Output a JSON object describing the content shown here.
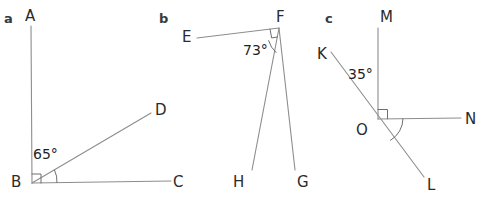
{
  "figure": {
    "background_color": "#ffffff",
    "line_color": "#8d8d8d",
    "label_color": "#2b2b2b",
    "panels": [
      {
        "letter": "a",
        "letter_pos": [
          4,
          23
        ],
        "vertex_labels": [
          {
            "text": "A",
            "x": 25,
            "y": 21
          },
          {
            "text": "B",
            "x": 11,
            "y": 187
          },
          {
            "text": "C",
            "x": 173,
            "y": 187
          },
          {
            "text": "D",
            "x": 155,
            "y": 115
          }
        ],
        "angle_labels": [
          {
            "text": "65°",
            "x": 33,
            "y": 159
          }
        ]
      },
      {
        "letter": "b",
        "letter_pos": [
          159,
          23
        ],
        "vertex_labels": [
          {
            "text": "E",
            "x": 182,
            "y": 42
          },
          {
            "text": "F",
            "x": 276,
            "y": 22
          },
          {
            "text": "G",
            "x": 297,
            "y": 187
          },
          {
            "text": "H",
            "x": 233,
            "y": 187
          }
        ],
        "angle_labels": [
          {
            "text": "73°",
            "x": 243,
            "y": 55
          }
        ]
      },
      {
        "letter": "c",
        "letter_pos": [
          325,
          23
        ],
        "vertex_labels": [
          {
            "text": "K",
            "x": 317,
            "y": 59
          },
          {
            "text": "L",
            "x": 427,
            "y": 190
          },
          {
            "text": "M",
            "x": 380,
            "y": 22
          },
          {
            "text": "N",
            "x": 465,
            "y": 124
          },
          {
            "text": "O",
            "x": 356,
            "y": 135
          }
        ],
        "angle_labels": [
          {
            "text": "35°",
            "x": 348,
            "y": 79
          }
        ]
      }
    ],
    "segments": [
      {
        "name": "segment-BA",
        "x1": 32,
        "y1": 183,
        "x2": 31,
        "y2": 26
      },
      {
        "name": "segment-BC",
        "x1": 32,
        "y1": 183,
        "x2": 171,
        "y2": 181
      },
      {
        "name": "segment-BD",
        "x1": 32,
        "y1": 183,
        "x2": 151,
        "y2": 113
      },
      {
        "name": "segment-FE",
        "x1": 279,
        "y1": 28,
        "x2": 197,
        "y2": 38
      },
      {
        "name": "segment-FH",
        "x1": 279,
        "y1": 28,
        "x2": 252,
        "y2": 170
      },
      {
        "name": "segment-FG",
        "x1": 279,
        "y1": 28,
        "x2": 295,
        "y2": 170
      },
      {
        "name": "segment-OM",
        "x1": 378,
        "y1": 119,
        "x2": 378,
        "y2": 28
      },
      {
        "name": "segment-ON",
        "x1": 378,
        "y1": 119,
        "x2": 461,
        "y2": 118
      },
      {
        "name": "segment-KL",
        "x1": 331,
        "y1": 52,
        "x2": 424,
        "y2": 177
      }
    ],
    "markers": [
      {
        "name": "right-angle-marker-B",
        "type": "square"
      },
      {
        "name": "angle-arc-DBC",
        "type": "arc"
      },
      {
        "name": "right-angle-marker-F",
        "type": "square"
      },
      {
        "name": "angle-arc-EFH",
        "type": "arc"
      },
      {
        "name": "right-angle-marker-O",
        "type": "square"
      },
      {
        "name": "angle-arc-NOL",
        "type": "arc"
      }
    ]
  }
}
